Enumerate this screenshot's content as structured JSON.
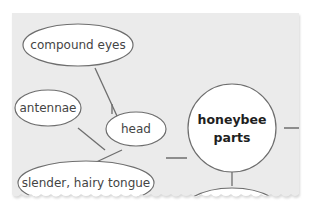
{
  "diagram": {
    "type": "concept-map",
    "center": {
      "label_line1": "honeybee",
      "label_line2": "parts"
    },
    "nodes": [
      {
        "id": "head",
        "label": "head"
      },
      {
        "id": "compound-eyes",
        "label": "compound eyes"
      },
      {
        "id": "antennae",
        "label": "antennae"
      },
      {
        "id": "tongue",
        "label": "slender, hairy tongue"
      },
      {
        "id": "bottom-node",
        "label": ""
      }
    ],
    "edges": [
      [
        "compound-eyes",
        "head"
      ],
      [
        "antennae",
        "head"
      ],
      [
        "tongue",
        "head"
      ],
      [
        "head",
        "honeybee parts"
      ],
      [
        "honeybee parts",
        "bottom-node"
      ],
      [
        "honeybee parts",
        "right-offscreen"
      ]
    ],
    "colors": {
      "panel": "#ebebeb",
      "stroke": "#6e6e6e",
      "node_fill": "#ffffff",
      "text": "#444444"
    }
  }
}
